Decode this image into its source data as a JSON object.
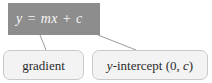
{
  "diagram": {
    "type": "annotated-equation",
    "background_color": "#ffffff",
    "equation": {
      "text": "y = mx + c",
      "parts": {
        "dependent_variable": "y",
        "equals": "=",
        "gradient_term": "mx",
        "plus": "+",
        "intercept_term": "c"
      },
      "box_fill_color": "#8d8d8d",
      "text_color": "#f6f6f6"
    },
    "callouts": [
      {
        "id": "gradient",
        "label": "gradient",
        "annotates": "m",
        "box_fill_color": "#f3f3f3",
        "box_border_color": "#c9c9c9"
      },
      {
        "id": "y-intercept",
        "label": "y-intercept (0, c)",
        "label_prefix": "y",
        "label_suffix": "-intercept (0, ",
        "label_italic_tail": "c",
        "label_close": ")",
        "annotates": "c",
        "box_fill_color": "#f3f3f3",
        "box_border_color": "#c9c9c9"
      }
    ],
    "leader_lines": [
      {
        "id": "gradient-leader",
        "from": [
          40,
          35
        ],
        "to": [
          46,
          50
        ],
        "color": "#9b9b9b"
      },
      {
        "id": "intercept-leader",
        "from": [
          98,
          35
        ],
        "to": [
          136,
          50
        ],
        "color": "#9b9b9b"
      }
    ]
  }
}
